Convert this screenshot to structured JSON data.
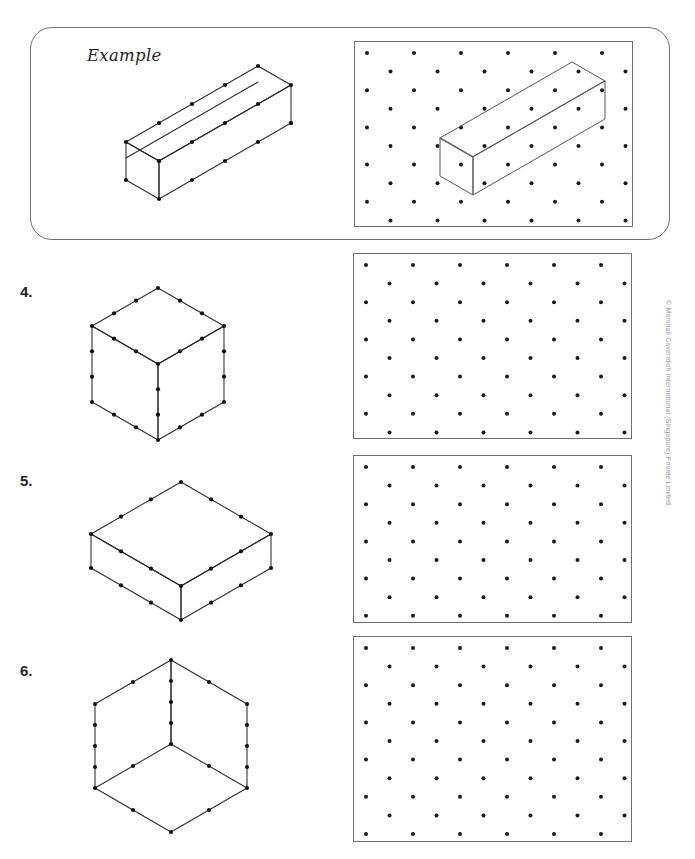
{
  "page": {
    "width": 695,
    "height": 859,
    "background": "#ffffff",
    "ink_color": "#231f20",
    "rule_color": "#6d6f74",
    "dot_color": "#1a1a1a"
  },
  "example": {
    "label": "Example",
    "panel": {
      "x": 30,
      "y": 27,
      "width": 640,
      "height": 213,
      "corner_radius": 22
    },
    "figure": {
      "name": "cuboid-4-by-1-by-1",
      "description": "Isometric cuboid, 4 units long, 1 unit wide, 1 unit tall, with unit dots marked on every edge",
      "dimensions": {
        "length": 4,
        "width": 1,
        "height": 1
      }
    },
    "grid": {
      "x": 353,
      "y": 40,
      "width": 279,
      "height": 186,
      "columns": 6,
      "rows": 11,
      "description": "Isometric dot grid with the worked cuboid already drawn on it"
    },
    "grid_figure": {
      "name": "cuboid-4-by-1-by-1-on-grid",
      "dimensions": {
        "length": 4,
        "width": 1,
        "height": 1
      }
    }
  },
  "questions": [
    {
      "number": "4.",
      "figure": {
        "name": "cube-3-by-3-by-3",
        "description": "Isometric cube with each edge divided into 3 units, dots at each unit",
        "dimensions": {
          "length": 3,
          "width": 3,
          "height": 3
        }
      },
      "grid": {
        "x": 353,
        "y": 253,
        "width": 279,
        "height": 186,
        "columns": 6,
        "rows": 11,
        "filled": false
      }
    },
    {
      "number": "5.",
      "figure": {
        "name": "cuboid-3-by-3-by-1",
        "description": "Flat isometric cuboid, 3 units long, 3 units wide, 1 unit tall",
        "dimensions": {
          "length": 3,
          "width": 3,
          "height": 1
        }
      },
      "grid": {
        "x": 353,
        "y": 455,
        "width": 279,
        "height": 168,
        "columns": 6,
        "rows": 10,
        "filled": false
      }
    },
    {
      "number": "6.",
      "figure": {
        "name": "open-cuboid-2-by-2-by-4",
        "description": "Tall open isometric cuboid shown as an inside corner, 2 units wide, 2 units deep, 4 units tall, top face open",
        "dimensions": {
          "length": 2,
          "width": 2,
          "height": 4
        }
      },
      "grid": {
        "x": 353,
        "y": 636,
        "width": 279,
        "height": 206,
        "columns": 6,
        "rows": 12,
        "filled": false
      }
    }
  ],
  "copyright": {
    "text": "© Marshall Cavendish International (Singapore) Private Limited."
  }
}
